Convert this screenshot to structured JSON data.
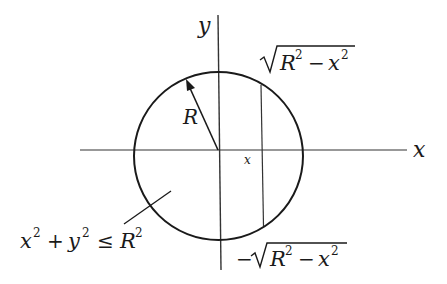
{
  "diagram": {
    "axes": {
      "x_label": "x",
      "y_label": "y"
    },
    "circle": {
      "radius_label": "R"
    },
    "slice": {
      "position_label": "x",
      "upper_bound": {
        "radical": "R",
        "exp1": "2",
        "minus": "−",
        "var": "x",
        "exp2": "2"
      },
      "lower_bound": {
        "sign": "−",
        "radical": "R",
        "exp1": "2",
        "minus": "−",
        "var": "x",
        "exp2": "2"
      }
    },
    "region_label": {
      "x": "x",
      "exp_x": "2",
      "plus": "+",
      "y": "y",
      "exp_y": "2",
      "leq": "≤",
      "R": "R",
      "exp_R": "2"
    },
    "colors": {
      "stroke": "#1a1a1a",
      "axis": "#333333",
      "background": "#ffffff"
    }
  }
}
